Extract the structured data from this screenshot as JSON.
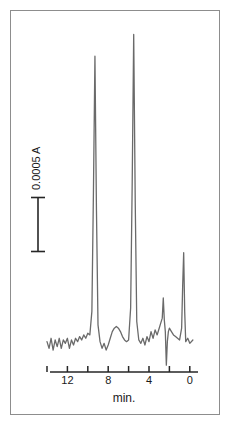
{
  "figure": {
    "kind": "chromatogram",
    "background_color": "#ffffff",
    "frame_color": "#8d8d8d",
    "trace_color": "#6a6a6a",
    "axis_color": "#262626",
    "text_color": "#1a1a1a"
  },
  "scalebar": {
    "label": "0.0005 A",
    "orientation": "vertical",
    "value": 0.0005,
    "units": "A"
  },
  "axis": {
    "title": "min.",
    "tick_labels": [
      "12",
      "8",
      "4",
      "0"
    ],
    "all_tick_values": [
      14,
      12,
      10,
      8,
      6,
      4,
      2,
      0
    ],
    "direction": "decreasing-left-to-right"
  },
  "chart_data": {
    "type": "line",
    "title": "",
    "subtitle": "",
    "xlabel": "min.",
    "ylabel": "0.0005 A",
    "xlim": [
      14,
      -1
    ],
    "ylim": [
      -0.00012,
      0.0019
    ],
    "grid": false,
    "legend": null,
    "annotations": [
      {
        "text": "0.0005 A",
        "role": "y-scale-bar",
        "from_min": 0.0,
        "to_min": 0.0005
      }
    ],
    "axis_ticks": {
      "x_major": [
        12,
        8,
        4,
        0
      ],
      "x_minor": [
        14,
        10,
        6,
        2
      ],
      "x_labeled": [
        "12",
        "8",
        "4",
        "0"
      ]
    },
    "baseline_value": 0.0,
    "peaks": [
      {
        "name": "peak-1",
        "retention_min": 9.3,
        "height": 0.00172,
        "width_min": 0.3,
        "label": ""
      },
      {
        "name": "peak-2",
        "retention_min": 5.5,
        "height": 0.00185,
        "width_min": 0.3,
        "label": ""
      },
      {
        "name": "peak-3",
        "retention_min": 2.6,
        "height": 0.00028,
        "width_min": 0.14,
        "label": ""
      },
      {
        "name": "peak-4",
        "retention_min": 2.3,
        "height": -0.00012,
        "width_min": 0.1,
        "label": ""
      },
      {
        "name": "peak-5",
        "retention_min": 0.6,
        "height": 0.00055,
        "width_min": 0.1,
        "label": ""
      }
    ],
    "series": [
      {
        "name": "absorbance",
        "x": [
          14.0,
          13.8,
          13.6,
          13.4,
          13.2,
          13.0,
          12.8,
          12.6,
          12.4,
          12.2,
          12.0,
          11.8,
          11.6,
          11.4,
          11.2,
          11.0,
          10.8,
          10.6,
          10.4,
          10.2,
          10.0,
          9.8,
          9.6,
          9.45,
          9.3,
          9.15,
          9.0,
          8.8,
          8.6,
          8.4,
          8.2,
          8.0,
          7.8,
          7.6,
          7.4,
          7.2,
          7.0,
          6.8,
          6.6,
          6.4,
          6.2,
          6.0,
          5.8,
          5.65,
          5.5,
          5.35,
          5.2,
          5.0,
          4.8,
          4.6,
          4.4,
          4.2,
          4.0,
          3.8,
          3.6,
          3.4,
          3.2,
          3.0,
          2.85,
          2.7,
          2.6,
          2.5,
          2.4,
          2.3,
          2.2,
          2.1,
          2.0,
          1.8,
          1.6,
          1.4,
          1.2,
          1.0,
          0.8,
          0.7,
          0.6,
          0.5,
          0.4,
          0.2,
          0.0,
          -0.3
        ],
        "y": [
          2e-05,
          -2e-05,
          4e-05,
          -3e-05,
          3e-05,
          -1e-05,
          4e-05,
          -2e-05,
          3e-05,
          1e-05,
          4e-05,
          -2e-05,
          3e-05,
          0.0,
          4e-05,
          2e-05,
          5e-05,
          3e-05,
          6e-05,
          4e-05,
          7e-05,
          6e-05,
          0.0002,
          0.0009,
          0.00172,
          0.0008,
          0.00012,
          2e-05,
          -2e-05,
          1e-05,
          -3e-05,
          0.0,
          4e-05,
          8e-05,
          0.0001,
          0.00011,
          0.0001,
          8e-05,
          5e-05,
          3e-05,
          2e-05,
          3e-05,
          0.00022,
          0.00095,
          0.00185,
          0.00085,
          0.00014,
          3e-05,
          1e-05,
          4e-05,
          0.0,
          5e-05,
          2e-05,
          8e-05,
          4e-05,
          9e-05,
          6e-05,
          0.0001,
          0.00013,
          0.00016,
          0.00028,
          0.00015,
          8e-05,
          -0.00012,
          2e-05,
          8e-05,
          0.0001,
          8e-05,
          6e-05,
          5e-05,
          4e-05,
          3e-05,
          0.0001,
          0.00035,
          0.00055,
          0.0002,
          2e-05,
          4e-05,
          1e-05,
          3e-05
        ]
      }
    ]
  }
}
